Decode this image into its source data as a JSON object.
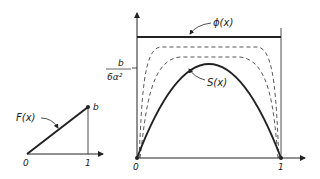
{
  "left_plot": {
    "curve_label": "F(x)",
    "end_label": "b",
    "x_origin": "0",
    "x_one": "1"
  },
  "right_plot": {
    "phi_label": "ϕ(x)",
    "s_label": "S(x)",
    "y_tick_numerator": "b",
    "y_tick_denominator": "6α²",
    "x_origin": "0",
    "x_one": "1"
  },
  "colors": {
    "ink": "#222222",
    "background": "#ffffff"
  }
}
